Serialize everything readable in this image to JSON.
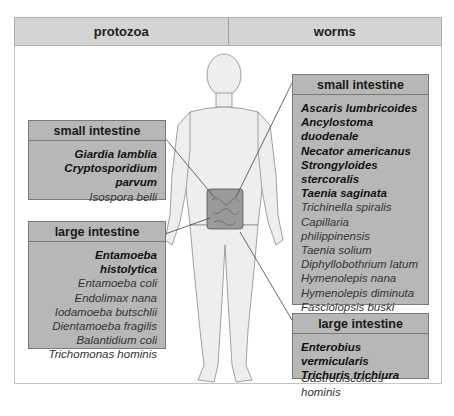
{
  "header": {
    "left": "protozoa",
    "right": "worms"
  },
  "protozoa": {
    "small_intestine": {
      "title": "small intestine",
      "major": [
        "Giardia lamblia",
        "Cryptosporidium parvum"
      ],
      "minor": [
        "Isospora belli"
      ]
    },
    "large_intestine": {
      "title": "large intestine",
      "major": [
        "Entamoeba histolytica"
      ],
      "minor": [
        "Entamoeba coli",
        "Endolimax nana",
        "Iodamoeba butschlii",
        "Dientamoeba fragilis",
        "Balantidium coli",
        "Trichomonas hominis"
      ]
    }
  },
  "worms": {
    "small_intestine": {
      "title": "small intestine",
      "major": [
        "Ascaris lumbricoides",
        "Ancylostoma duodenale",
        "Necator americanus",
        "Strongyloides stercoralis",
        "Taenia saginata"
      ],
      "minor": [
        "Trichinella spiralis",
        "Capillaria philippinensis",
        "Taenia solium",
        "Diphyllobothrium latum",
        "Hymenolepis nana",
        "Hymenolepis diminuta",
        "Fasciolopsis buski",
        "Metagonimus yokogawi",
        "Heterophyes heterophyes",
        "Gastrodiscoides hominis"
      ]
    },
    "large_intestine": {
      "title": "large intestine",
      "major": [
        "Enterobius vermicularis",
        "Trichuris trichiura"
      ],
      "minor": []
    }
  },
  "colors": {
    "header_bg": "#d4d4d4",
    "box_bg": "#b7b7b7",
    "intestine": "#9a9a9a",
    "body_fill": "#ececec"
  }
}
